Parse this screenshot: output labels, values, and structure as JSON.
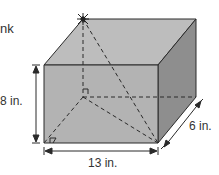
{
  "figure": {
    "partial_text": "nk",
    "labels": {
      "height": "8 in.",
      "width": "13 in.",
      "depth": "6 in."
    },
    "dimensions": {
      "length_in": 13,
      "width_in": 6,
      "height_in": 8
    },
    "markers": {
      "top_vertex": "spider-star-icon",
      "right_angle_back": "right-angle-icon",
      "right_angle_front": "right-angle-icon"
    },
    "colors": {
      "front_face": "#b4b4b4",
      "top_face": "#bdbdbd",
      "side_face": "#8c8c8c",
      "edge": "#2a2a2a",
      "dashed": "#2a2a2a",
      "text": "#333333"
    }
  }
}
